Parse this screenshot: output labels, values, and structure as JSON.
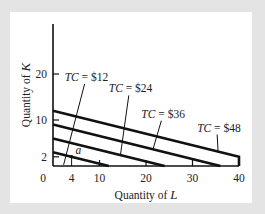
{
  "chart_data": {
    "type": "line",
    "title": "",
    "xlabel": "Quantity of L",
    "ylabel": "Quantity of K",
    "xlabel_parts": {
      "text": "Quantity of ",
      "var": "L"
    },
    "ylabel_parts": {
      "text": "Quantity of ",
      "var": "K"
    },
    "xlim": [
      0,
      40
    ],
    "ylim": [
      0,
      30
    ],
    "x_ticks": [
      0,
      4,
      10,
      20,
      30,
      40
    ],
    "y_ticks": [
      2,
      10,
      20
    ],
    "grid": false,
    "legend": "inline labels with callout lines",
    "series": [
      {
        "name": "TC = $12",
        "x": [
          0,
          12
        ],
        "y": [
          3,
          0
        ],
        "label_at": [
          2.5,
          18.5
        ]
      },
      {
        "name": "TC = $24",
        "x": [
          0,
          24
        ],
        "y": [
          6,
          0
        ],
        "label_at": [
          12,
          16
        ]
      },
      {
        "name": "TC = $36",
        "x": [
          0,
          36
        ],
        "y": [
          9,
          0
        ],
        "label_at": [
          19,
          10.5
        ]
      },
      {
        "name": "TC = $48",
        "x": [
          0,
          40,
          40
        ],
        "y": [
          12,
          2,
          0
        ],
        "label_at": [
          31,
          7.5
        ]
      }
    ],
    "annotations": [
      {
        "label": "a",
        "x": 4,
        "y": 2,
        "type": "point"
      }
    ]
  },
  "labels": {
    "tc": [
      "TC = $12",
      "TC = $24",
      "TC = $36",
      "TC = $48"
    ],
    "point_a": "a",
    "origin": "0"
  },
  "colors": {
    "frame": "#e4e4e4",
    "panel": "#ffffff",
    "ink": "#111111"
  }
}
